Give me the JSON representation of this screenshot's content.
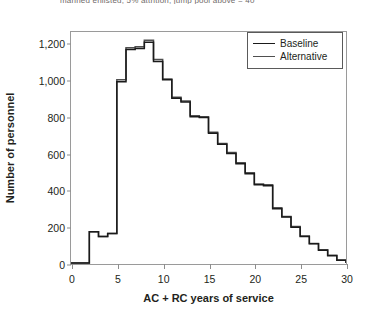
{
  "title_sliver": "manned enlisted; 5% attrition; jump pool above = 40",
  "chart_data": {
    "type": "line",
    "subtype": "step-histogram",
    "title": "",
    "xlabel": "AC + RC years of service",
    "ylabel": "Number of personnel",
    "xlim": [
      0,
      30
    ],
    "ylim": [
      0,
      1260
    ],
    "xticks": [
      0,
      5,
      10,
      15,
      20,
      25,
      30
    ],
    "xtick_labels": [
      "0",
      "5",
      "10",
      "15",
      "20",
      "25",
      "30"
    ],
    "yticks": [
      0,
      200,
      400,
      600,
      800,
      1000,
      1200
    ],
    "ytick_labels": [
      "0",
      "200",
      "400",
      "600",
      "800",
      "1,000",
      "1,200"
    ],
    "grid": false,
    "legend_position": "top-right",
    "x": [
      0,
      1,
      2,
      3,
      4,
      5,
      6,
      7,
      8,
      9,
      10,
      11,
      12,
      13,
      14,
      15,
      16,
      17,
      18,
      19,
      20,
      21,
      22,
      23,
      24,
      25,
      26,
      27,
      28,
      29,
      30
    ],
    "series": [
      {
        "name": "Baseline",
        "color": "#1a1a1a",
        "values": [
          5,
          5,
          175,
          150,
          165,
          990,
          1165,
          1170,
          1205,
          1100,
          1000,
          900,
          880,
          800,
          795,
          710,
          650,
          600,
          545,
          490,
          430,
          425,
          300,
          255,
          200,
          150,
          110,
          75,
          45,
          20,
          5
        ]
      },
      {
        "name": "Alternative",
        "color": "#4f4f4f",
        "values": [
          5,
          5,
          175,
          150,
          165,
          1000,
          1175,
          1180,
          1215,
          1110,
          1005,
          905,
          885,
          805,
          800,
          715,
          655,
          605,
          550,
          495,
          435,
          430,
          305,
          258,
          203,
          152,
          112,
          78,
          47,
          22,
          6
        ]
      }
    ]
  },
  "legend": {
    "items": [
      {
        "label": "Baseline"
      },
      {
        "label": "Alternative"
      }
    ]
  }
}
